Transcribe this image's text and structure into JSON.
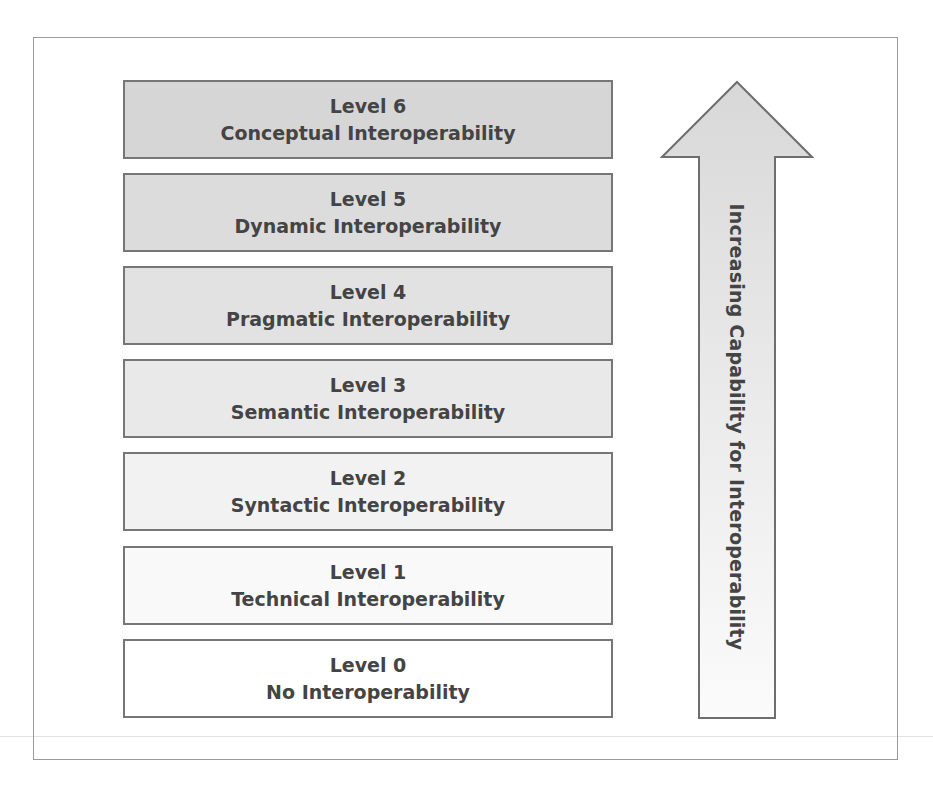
{
  "diagram": {
    "levels": [
      {
        "level": "Level 6",
        "name": "Conceptual Interoperability",
        "fill": "#d6d6d6"
      },
      {
        "level": "Level 5",
        "name": "Dynamic Interoperability",
        "fill": "#dcdcdc"
      },
      {
        "level": "Level 4",
        "name": "Pragmatic Interoperability",
        "fill": "#e2e2e2"
      },
      {
        "level": "Level 3",
        "name": "Semantic Interoperability",
        "fill": "#e9e9e9"
      },
      {
        "level": "Level 2",
        "name": "Syntactic Interoperability",
        "fill": "#f2f2f2"
      },
      {
        "level": "Level 1",
        "name": "Technical Interoperability",
        "fill": "#f9f9f9"
      },
      {
        "level": "Level 0",
        "name": "No Interoperability",
        "fill": "#ffffff"
      }
    ],
    "arrow": {
      "label": "Increasing Capability for Interoperability",
      "direction": "up",
      "fill_top": "#d8d8d8",
      "fill_bottom": "#fbfbfb",
      "stroke": "#6e6e6e"
    },
    "text_color": "#444444",
    "box_border_color": "#767676"
  }
}
